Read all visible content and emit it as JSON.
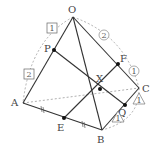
{
  "diagram": {
    "points": {
      "O": {
        "label": "O",
        "x": 73,
        "y": 17
      },
      "P": {
        "label": "P",
        "x": 54,
        "y": 50
      },
      "A": {
        "label": "A",
        "x": 23,
        "y": 103
      },
      "E": {
        "label": "E",
        "x": 64,
        "y": 118
      },
      "B": {
        "label": "B",
        "x": 102,
        "y": 130
      },
      "C": {
        "label": "C",
        "x": 139,
        "y": 88
      },
      "F": {
        "label": "F",
        "x": 118,
        "y": 64
      },
      "Q": {
        "label": "Q",
        "x": 125,
        "y": 105
      },
      "X": {
        "label": "X",
        "x": 100,
        "y": 89
      }
    },
    "ratio_marks": {
      "box_1": "1",
      "box_2": "2",
      "circle_2": "2",
      "circle_1": "1",
      "triangle_1a": "1",
      "triangle_1b": "1"
    },
    "equal_marks": "//"
  }
}
